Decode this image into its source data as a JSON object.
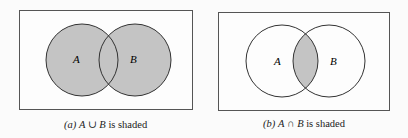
{
  "figures": [
    {
      "id": "a",
      "shaded": "union",
      "label_a": "A",
      "label_b": "B",
      "caption": {
        "prefix": "(a)",
        "expr_a": "A",
        "op": "∪",
        "expr_b": "B",
        "suffix": "is shaded"
      }
    },
    {
      "id": "b",
      "shaded": "intersection",
      "label_a": "A",
      "label_b": "B",
      "caption": {
        "prefix": "(b)",
        "expr_a": "A",
        "op": "∩",
        "expr_b": "B",
        "suffix": "is shaded"
      }
    }
  ],
  "colors": {
    "shade": "#c4c4c4",
    "stroke": "#333333",
    "background": "#fbfbfb"
  }
}
